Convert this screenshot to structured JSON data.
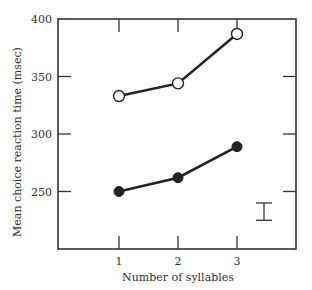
{
  "chart_data": {
    "type": "line",
    "title": "",
    "xlabel": "Number of syllables",
    "ylabel": "Mean choice reaction time (msec)",
    "x": [
      1,
      2,
      3
    ],
    "x_ticks": [
      "1",
      "2",
      "3"
    ],
    "y_ticks": [
      "250",
      "300",
      "350",
      "400"
    ],
    "ylim": [
      200,
      400
    ],
    "xlim": [
      0,
      4
    ],
    "grid": false,
    "legend": null,
    "series": [
      {
        "name": "open-circles",
        "marker": "open-circle",
        "values": [
          333,
          344,
          387
        ]
      },
      {
        "name": "filled-circles",
        "marker": "filled-circle",
        "values": [
          250,
          262,
          289
        ]
      }
    ],
    "annotations": [
      {
        "type": "error-bar",
        "description": "representative standard error bar",
        "x_position": "right of x=3",
        "y_range": [
          225,
          240
        ]
      }
    ]
  },
  "colors": {
    "axis": "#333333",
    "line": "#222222",
    "open_marker_fill": "#ffffff",
    "filled_marker_fill": "#222222"
  }
}
